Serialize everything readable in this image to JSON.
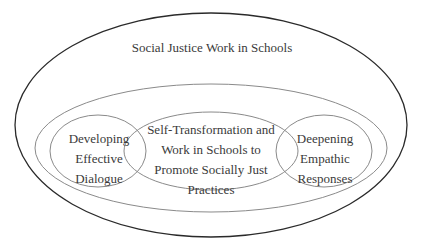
{
  "diagram": {
    "outer": {
      "label": "Social Justice Work in Schools"
    },
    "left": {
      "label": "Developing\nEffective\nDialogue"
    },
    "center": {
      "label": "Self-Transformation and\nWork in Schools to\nPromote Socially Just\nPractices"
    },
    "right": {
      "label": "Deepening\nEmpathic\nResponses"
    }
  },
  "colors": {
    "outer_stroke": "#2a2a2a",
    "inner_stroke": "#8a8a8a",
    "text": "#3a3a3a",
    "background": "#ffffff"
  }
}
